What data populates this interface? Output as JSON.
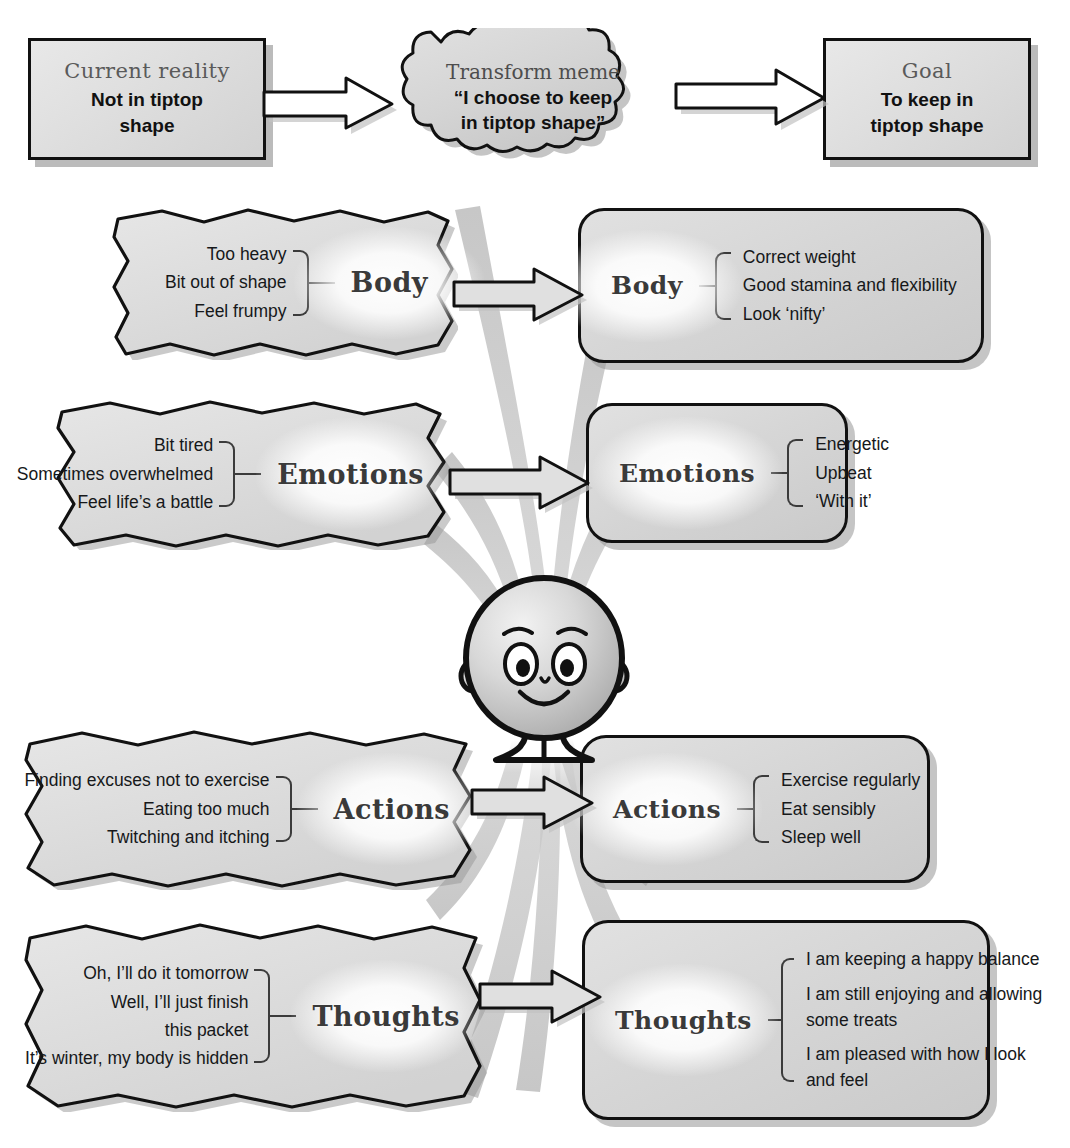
{
  "diagram": {
    "colors": {
      "box_fill": "#dcdcdc",
      "outline": "#111111",
      "shadow": "#969696",
      "label_text": "#3a3a3a",
      "heading_text": "#5a5a5a"
    }
  },
  "top_row": {
    "current": {
      "heading": "Current reality",
      "body": "Not in tiptop\nshape"
    },
    "meme": {
      "heading": "Transform meme",
      "body": "“I choose to keep\nin tiptop shape”"
    },
    "goal": {
      "heading": "Goal",
      "body": "To keep in\ntiptop shape"
    }
  },
  "sections": [
    {
      "key": "body",
      "label": "Body",
      "current": {
        "label": "Body",
        "items": [
          "Too heavy",
          "Bit out of shape",
          "Feel frumpy"
        ]
      },
      "goal": {
        "label": "Body",
        "items": [
          "Correct weight",
          "Good stamina and flexibility",
          "Look ‘nifty’"
        ]
      }
    },
    {
      "key": "emotions",
      "label": "Emotions",
      "current": {
        "label": "Emotions",
        "items": [
          "Bit tired",
          "Sometimes overwhelmed",
          "Feel life’s a battle"
        ]
      },
      "goal": {
        "label": "Emotions",
        "items": [
          "Energetic",
          "Upbeat",
          "‘With it’"
        ]
      }
    },
    {
      "key": "actions",
      "label": "Actions",
      "current": {
        "label": "Actions",
        "items": [
          "Finding excuses not to exercise",
          "Eating too much",
          "Twitching and itching"
        ]
      },
      "goal": {
        "label": "Actions",
        "items": [
          "Exercise regularly",
          "Eat sensibly",
          "Sleep well"
        ]
      }
    },
    {
      "key": "thoughts",
      "label": "Thoughts",
      "current": {
        "label": "Thoughts",
        "items": [
          "Oh, I’ll do it tomorrow",
          "Well, I’ll just finish",
          "this packet",
          "It’s winter, my body is hidden"
        ]
      },
      "goal": {
        "label": "Thoughts",
        "items": [
          "I am keeping a happy balance",
          "I am still enjoying and allowing some treats",
          "I am pleased with how I look and feel"
        ]
      }
    }
  ],
  "character": {
    "name": "smiling-person-figure",
    "expression": "smiling"
  }
}
